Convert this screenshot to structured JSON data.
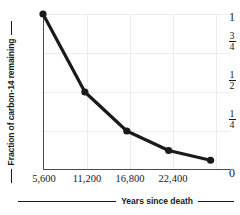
{
  "chart_data": {
    "type": "line",
    "title": "",
    "xlabel": "Years since death",
    "ylabel": "Fraction of carbon-14 remaining",
    "x": [
      0,
      5600,
      11200,
      16800,
      22400
    ],
    "values": [
      1,
      0.5,
      0.25,
      0.125,
      0.0625
    ],
    "point_labels": [
      "1",
      "1/2",
      "1/4",
      "1/8",
      "1/16"
    ],
    "xlim": [
      0,
      25000
    ],
    "ylim": [
      0,
      1
    ],
    "xticks": [
      5600,
      11200,
      16800,
      22400
    ],
    "xtick_labels": [
      "5,600",
      "11,200",
      "16,800",
      "22,400"
    ],
    "yticks": [
      0,
      0.25,
      0.5,
      0.75,
      1
    ],
    "ytick_labels": [
      "0",
      "1/4",
      "1/2",
      "3/4",
      "1"
    ],
    "grid": true,
    "legend": "none",
    "series_color": "#1a1a1a",
    "grid_color": "#ececec",
    "axis_color": "#4a4a4a",
    "marker": "circle"
  },
  "axis": {
    "y_title": "Fraction of carbon-14 remaining",
    "x_title": "Years since death",
    "y_ticks": [
      {
        "label": "1",
        "kind": "whole"
      },
      {
        "label": "3/4",
        "kind": "fraction",
        "num": "3",
        "den": "4"
      },
      {
        "label": "1/2",
        "kind": "fraction",
        "num": "1",
        "den": "2"
      },
      {
        "label": "1/4",
        "kind": "fraction",
        "num": "1",
        "den": "4"
      },
      {
        "label": "0",
        "kind": "whole"
      }
    ],
    "x_ticks": [
      "5,600",
      "11,200",
      "16,800",
      "22,400"
    ]
  }
}
